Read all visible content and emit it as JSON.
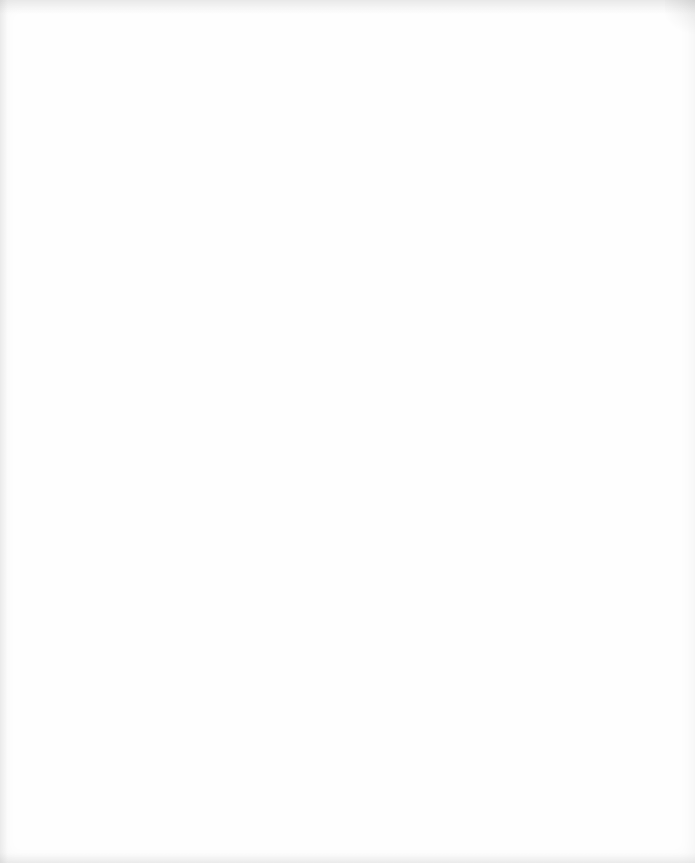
{
  "document": {
    "type": "scanned-blank-page",
    "visible_text": [],
    "faint_marks": [
      {
        "x": 88,
        "y": 680,
        "text": ""
      },
      {
        "x": 10,
        "y": 735,
        "text": ""
      }
    ]
  }
}
